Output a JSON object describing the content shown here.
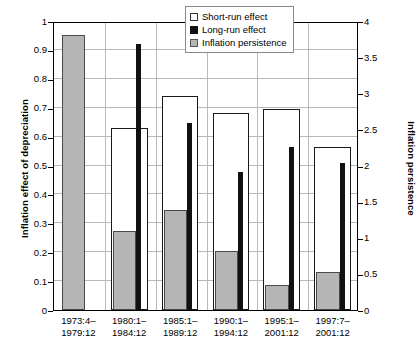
{
  "chart_data": {
    "type": "bar",
    "title": "",
    "subtitle": "",
    "xlabel": "",
    "ylabel": "Inflation effect of depreciation",
    "ylabel_secondary": "Inflation persistence",
    "ylim": [
      0,
      1
    ],
    "ylim_secondary": [
      0,
      4
    ],
    "yticks": [
      "0",
      "0.1",
      "0.2",
      "0.3",
      "0.4",
      "0.5",
      "0.6",
      "0.7",
      "0.8",
      "0.9",
      "1"
    ],
    "ytick_values": [
      0,
      0.1,
      0.2,
      0.3,
      0.4,
      0.5,
      0.6,
      0.7,
      0.8,
      0.9,
      1
    ],
    "yticks_secondary": [
      "0",
      "0.5",
      "1",
      "1.5",
      "2",
      "2.5",
      "3",
      "3.5",
      "4"
    ],
    "ytick_values_secondary": [
      0,
      0.5,
      1,
      1.5,
      2,
      2.5,
      3,
      3.5,
      4
    ],
    "grid": true,
    "grid_axis": "y",
    "legend_position": "top-right",
    "categories": [
      "1973:4–1979:12",
      "1980:1–1984:12",
      "1985:1–1989:12",
      "1990:1–1994:12",
      "1995:1–2001:12",
      "1997:7–2001:12"
    ],
    "categories_lines": [
      [
        "1973:4–",
        "1979:12"
      ],
      [
        "1980:1–",
        "1984:12"
      ],
      [
        "1985:1–",
        "1989:12"
      ],
      [
        "1990:1–",
        "1994:12"
      ],
      [
        "1995:1–",
        "2001:12"
      ],
      [
        "1997:7–",
        "2001:12"
      ]
    ],
    "series": [
      {
        "name": "Short-run effect",
        "axis": "left",
        "color": "#ffffff",
        "edge_color": "#1a1a1a",
        "values": [
          null,
          0.63,
          0.74,
          0.68,
          0.695,
          0.565
        ]
      },
      {
        "name": "Long-run effect",
        "axis": "left",
        "color": "#111111",
        "edge_color": "#111111",
        "values": [
          null,
          0.92,
          0.648,
          0.478,
          0.563,
          0.51
        ]
      },
      {
        "name": "Inflation persistence",
        "axis": "right",
        "color": "#b5b5b5",
        "edge_color": "#4a4a4a",
        "values": [
          3.8,
          1.09,
          1.39,
          0.82,
          0.34,
          0.53
        ],
        "values_left_scale": [
          0.95,
          0.272,
          0.348,
          0.205,
          0.085,
          0.133
        ]
      }
    ]
  },
  "legend": {
    "items": [
      {
        "label": "Short-run effect",
        "swatch": "open-square-swatch"
      },
      {
        "label": "Long-run effect",
        "swatch": "filled-black-square-swatch"
      },
      {
        "label": "Inflation persistence",
        "swatch": "filled-gray-square-swatch"
      }
    ]
  },
  "colors": {
    "short_run": "#ffffff",
    "long_run": "#111111",
    "persistence": "#b5b5b5",
    "gridline": "#b9b9b9",
    "axis": "#000000",
    "background": "#ffffff"
  }
}
